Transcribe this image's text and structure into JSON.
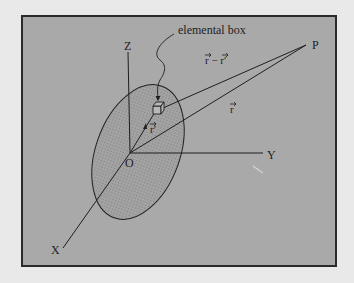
{
  "diagram": {
    "labels": {
      "elemental_box": "elemental box",
      "axis_z": "Z",
      "axis_y": "Y",
      "axis_x": "X",
      "origin": "O",
      "point_p": "P",
      "vec_r_minus_rprime": "r − r′",
      "vec_r": "r",
      "vec_rprime": "r′"
    },
    "colors": {
      "frame_fill": "#a9a9a9",
      "frame_border": "#2a2a2a",
      "page_background": "#e9e9e9",
      "ink": "#1e1e1e",
      "ellipse_fill": "#a2a2a2",
      "dot_pattern": "#6a6a6a"
    }
  }
}
